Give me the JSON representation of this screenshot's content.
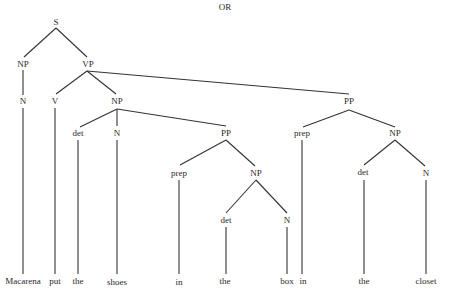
{
  "title": "OR",
  "nodes": {
    "s": "S",
    "np_subj": "NP",
    "vp": "VP",
    "n_subj": "N",
    "v": "V",
    "np_obj": "NP",
    "pp_outer": "PP",
    "det_obj": "det",
    "n_obj": "N",
    "pp_inner": "PP",
    "prep_outer": "prep",
    "np_outer": "NP",
    "prep_inner": "prep",
    "np_inner": "NP",
    "det_outer": "det",
    "n_outer": "N",
    "det_inner": "det",
    "n_inner": "N"
  },
  "leaves": [
    "Macarena",
    "put",
    "the",
    "shoes",
    "in",
    "the",
    "box",
    "in",
    "the",
    "closet"
  ]
}
